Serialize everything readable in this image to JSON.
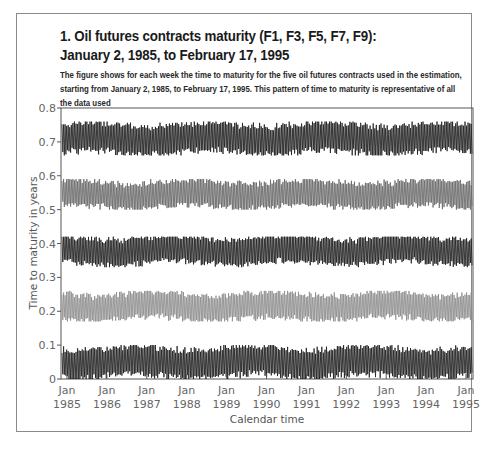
{
  "figure": {
    "title_line1": "1. Oil futures contracts maturity (F1, F3, F5, F7, F9):",
    "title_line2": "January 2, 1985, to February 17, 1995",
    "caption": "The figure shows for each week the time to maturity for the five oil futures contracts used in the estimation, starting from January 2, 1985, to February 17, 1995. This pattern of time to maturity is representative of all the data used"
  },
  "colors": {
    "frame": "#8a8a8a",
    "axis": "#555555",
    "series_dark": "#1a1a1a",
    "series_mid": "#555555",
    "series_light": "#8c8c8c",
    "tick_text": "#666666"
  },
  "chart_data": {
    "type": "line",
    "title": "1. Oil futures contracts maturity (F1, F3, F5, F7, F9): January 2, 1985, to February 17, 1995",
    "xlabel": "Calendar time",
    "ylabel": "Time to maturity in years",
    "ylim": [
      0,
      0.8
    ],
    "yticks": [
      0,
      0.1,
      0.2,
      0.3,
      0.4,
      0.5,
      0.6,
      0.7,
      0.8
    ],
    "ytick_labels": [
      "0",
      "0.1",
      "0.2",
      "0.3",
      "0.4",
      "0.5",
      "0.6",
      "0.7",
      "0.8"
    ],
    "xticks": [
      "Jan 1985",
      "Jan 1986",
      "Jan 1987",
      "Jan 1988",
      "Jan 1989",
      "Jan 1990",
      "Jan 1991",
      "Jan 1992",
      "Jan 1993",
      "Jan 1994",
      "Jan 1995"
    ],
    "xtick_months": [
      "Jan",
      "Jan",
      "Jan",
      "Jan",
      "Jan",
      "Jan",
      "Jan",
      "Jan",
      "Jan",
      "Jan",
      "Jan"
    ],
    "xtick_years": [
      "1985",
      "1986",
      "1987",
      "1988",
      "1989",
      "1990",
      "1991",
      "1992",
      "1993",
      "1994",
      "1995"
    ],
    "x_range": [
      "1985-01-02",
      "1995-02-17"
    ],
    "frequency": "weekly",
    "grid": false,
    "legend": "none",
    "pattern": "sawtooth oscillation with ~monthly period (contract rollover)",
    "series": [
      {
        "name": "F9",
        "center": 0.71,
        "min": 0.66,
        "max": 0.76,
        "color": "#1a1a1a"
      },
      {
        "name": "F7",
        "center": 0.545,
        "min": 0.5,
        "max": 0.59,
        "color": "#666666"
      },
      {
        "name": "F5",
        "center": 0.38,
        "min": 0.33,
        "max": 0.42,
        "color": "#1a1a1a"
      },
      {
        "name": "F3",
        "center": 0.215,
        "min": 0.17,
        "max": 0.26,
        "color": "#8c8c8c"
      },
      {
        "name": "F1",
        "center": 0.05,
        "min": 0.0,
        "max": 0.1,
        "color": "#1a1a1a"
      }
    ]
  }
}
